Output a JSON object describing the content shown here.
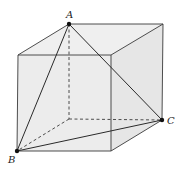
{
  "diagram": {
    "type": "cube-geometry",
    "face_fill": "#ececec",
    "line_color": "#3a3a3a",
    "vertices": {
      "A": {
        "x": 69,
        "y": 24,
        "label": "A",
        "marked": true
      },
      "B": {
        "x": 17,
        "y": 151,
        "label": "B",
        "marked": true
      },
      "C": {
        "x": 162,
        "y": 120,
        "label": "C",
        "marked": true
      },
      "TBR": {
        "x": 163,
        "y": 24
      },
      "FTL": {
        "x": 18,
        "y": 55
      },
      "FTR": {
        "x": 111,
        "y": 55
      },
      "HBL": {
        "x": 69,
        "y": 119
      },
      "FBR": {
        "x": 111,
        "y": 151
      }
    },
    "labels": {
      "A": "A",
      "B": "B",
      "C": "C"
    },
    "solid_edges": [
      "A-TBR",
      "A-FTL",
      "FTL-FTR",
      "FTR-TBR",
      "TBR-C",
      "FTL-B",
      "FTR-FBR",
      "B-FBR",
      "FBR-C"
    ],
    "dashed_edges": [
      "A-HBL",
      "HBL-C",
      "HBL-B"
    ],
    "triangle_edges": [
      "A-B",
      "A-C",
      "B-C"
    ],
    "triangle_dashed_edges": [
      "B-C-inner"
    ]
  }
}
